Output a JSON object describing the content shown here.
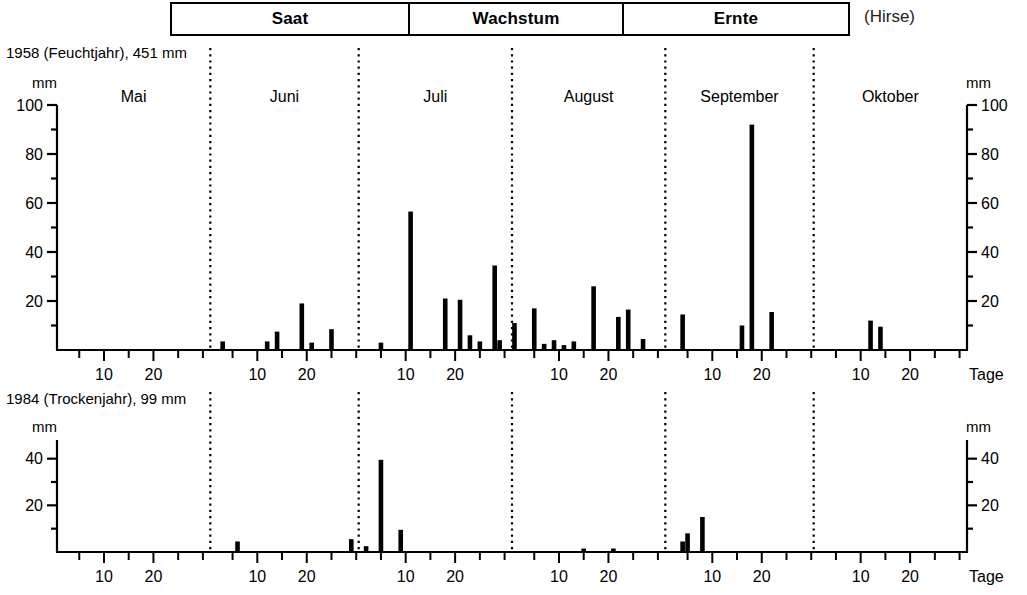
{
  "header": {
    "phases": [
      {
        "label": "Saat"
      },
      {
        "label": "Wachstum"
      },
      {
        "label": "Ernte"
      }
    ],
    "crop": "(Hirse)"
  },
  "axis": {
    "unit": "mm",
    "time_unit": "Tage",
    "day_ticks": [
      "10",
      "20"
    ]
  },
  "months": [
    "Mai",
    "Juni",
    "Juli",
    "August",
    "September",
    "Oktober"
  ],
  "chart_data": [
    {
      "id": "panel-1958",
      "type": "bar",
      "title": "1958 (Feuchtjahr), 451 mm",
      "year": "1958",
      "year_type": "Feuchtjahr",
      "total_mm": "451 mm",
      "xlabel": "Tage",
      "ylabel": "mm",
      "ylim": [
        0,
        100
      ],
      "yticks": [
        0,
        10,
        20,
        30,
        40,
        50,
        60,
        70,
        80,
        90,
        100
      ],
      "ytick_labels": [
        "20",
        "40",
        "60",
        "80",
        "100"
      ],
      "ytick_labeled_values": [
        20,
        40,
        60,
        80,
        100
      ],
      "grid": false,
      "legend": "none",
      "months": [
        "Mai",
        "Juni",
        "Juli",
        "August",
        "September",
        "Oktober"
      ],
      "month_days": [
        31,
        30,
        31,
        31,
        30,
        31
      ],
      "series": [
        {
          "name": "Niederschlag",
          "color": "#000000",
          "points": [
            {
              "month": "Juni",
              "day": 3,
              "value": 3.5
            },
            {
              "month": "Juni",
              "day": 12,
              "value": 3.5
            },
            {
              "month": "Juni",
              "day": 14,
              "value": 7.5
            },
            {
              "month": "Juni",
              "day": 19,
              "value": 19
            },
            {
              "month": "Juni",
              "day": 21,
              "value": 3
            },
            {
              "month": "Juni",
              "day": 25,
              "value": 8.5
            },
            {
              "month": "Juli",
              "day": 5,
              "value": 3
            },
            {
              "month": "Juli",
              "day": 11,
              "value": 56.5
            },
            {
              "month": "Juli",
              "day": 18,
              "value": 21
            },
            {
              "month": "Juli",
              "day": 21,
              "value": 20.5
            },
            {
              "month": "Juli",
              "day": 23,
              "value": 6
            },
            {
              "month": "Juli",
              "day": 25,
              "value": 3.5
            },
            {
              "month": "Juli",
              "day": 28,
              "value": 34.5
            },
            {
              "month": "Juli",
              "day": 29,
              "value": 4
            },
            {
              "month": "August",
              "day": 1,
              "value": 11
            },
            {
              "month": "August",
              "day": 5,
              "value": 17
            },
            {
              "month": "August",
              "day": 7,
              "value": 2.5
            },
            {
              "month": "August",
              "day": 9,
              "value": 4
            },
            {
              "month": "August",
              "day": 11,
              "value": 2
            },
            {
              "month": "August",
              "day": 13,
              "value": 3.5
            },
            {
              "month": "August",
              "day": 17,
              "value": 26
            },
            {
              "month": "August",
              "day": 22,
              "value": 13.5
            },
            {
              "month": "August",
              "day": 24,
              "value": 16.5
            },
            {
              "month": "August",
              "day": 27,
              "value": 4.5
            },
            {
              "month": "September",
              "day": 4,
              "value": 14.5
            },
            {
              "month": "September",
              "day": 16,
              "value": 10
            },
            {
              "month": "September",
              "day": 18,
              "value": 92
            },
            {
              "month": "September",
              "day": 22,
              "value": 15.5
            },
            {
              "month": "Oktober",
              "day": 12,
              "value": 12
            },
            {
              "month": "Oktober",
              "day": 14,
              "value": 9.5
            }
          ]
        }
      ]
    },
    {
      "id": "panel-1984",
      "type": "bar",
      "title": "1984 (Trockenjahr), 99 mm",
      "year": "1984",
      "year_type": "Trockenjahr",
      "total_mm": "99 mm",
      "xlabel": "Tage",
      "ylabel": "mm",
      "ylim": [
        0,
        48
      ],
      "yticks": [
        0,
        10,
        20,
        30,
        40
      ],
      "ytick_labels": [
        "20",
        "40"
      ],
      "ytick_labeled_values": [
        20,
        40
      ],
      "grid": false,
      "legend": "none",
      "months": [
        "Mai",
        "Juni",
        "Juli",
        "August",
        "September",
        "Oktober"
      ],
      "month_days": [
        31,
        30,
        31,
        31,
        30,
        31
      ],
      "series": [
        {
          "name": "Niederschlag",
          "color": "#000000",
          "points": [
            {
              "month": "Juni",
              "day": 6,
              "value": 4.5
            },
            {
              "month": "Juni",
              "day": 29,
              "value": 5.5
            },
            {
              "month": "Juli",
              "day": 2,
              "value": 2.5
            },
            {
              "month": "Juli",
              "day": 5,
              "value": 39.5
            },
            {
              "month": "Juli",
              "day": 9,
              "value": 9.5
            },
            {
              "month": "August",
              "day": 15,
              "value": 1.5
            },
            {
              "month": "August",
              "day": 21,
              "value": 1.5
            },
            {
              "month": "September",
              "day": 4,
              "value": 4.5
            },
            {
              "month": "September",
              "day": 5,
              "value": 8
            },
            {
              "month": "September",
              "day": 8,
              "value": 15
            }
          ]
        }
      ]
    }
  ]
}
